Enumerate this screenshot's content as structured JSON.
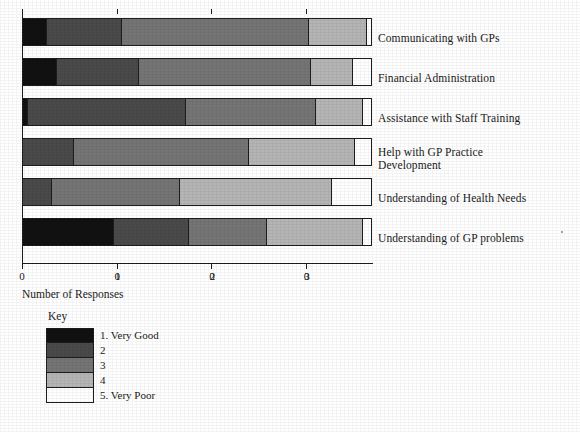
{
  "chart_data": {
    "type": "bar",
    "orientation": "horizontal",
    "stacked": true,
    "title": "",
    "xlabel": "Number of Responses",
    "ylabel": "",
    "xlim": [
      0,
      37
    ],
    "xticks": [
      0,
      10,
      20,
      30
    ],
    "xtick_labels": [
      "0",
      "10",
      "20",
      "30"
    ],
    "grid": false,
    "legend_title": "Key",
    "legend_position": "below-left",
    "categories": [
      "Communicating with GPs",
      "Financial Administration",
      "Assistance with Staff Training",
      "Help with GP Practice\nDevelopment",
      "Understanding of Health Needs",
      "Understanding of GP problems"
    ],
    "series": [
      {
        "name": "1. Very Good",
        "color": "#111111",
        "values": [
          2.5,
          3.5,
          0.4,
          0,
          0,
          9.7
        ]
      },
      {
        "name": "2",
        "color": "#4a4a4a",
        "values": [
          8.0,
          8.8,
          17.1,
          5.3,
          3.0,
          8.0
        ]
      },
      {
        "name": "3",
        "color": "#757575",
        "values": [
          19.9,
          18.4,
          14.0,
          18.7,
          13.8,
          8.3
        ]
      },
      {
        "name": "4",
        "color": "#b5b5b5",
        "values": [
          6.2,
          4.5,
          5.0,
          11.4,
          16.4,
          10.3
        ]
      },
      {
        "name": "5. Very Poor",
        "color": "#ffffff",
        "values": [
          0.5,
          2.0,
          1.0,
          1.8,
          4.3,
          1.0
        ]
      }
    ]
  },
  "axis": {
    "x_title": "Number of Responses",
    "tick_labels": [
      "0",
      "10",
      "20",
      "30"
    ]
  },
  "legend": {
    "title": "Key",
    "entries": [
      {
        "label": "1. Very Good",
        "color": "#111111"
      },
      {
        "label": "2",
        "color": "#4a4a4a"
      },
      {
        "label": "3",
        "color": "#757575"
      },
      {
        "label": "4",
        "color": "#b5b5b5"
      },
      {
        "label": "5. Very Poor",
        "color": "#ffffff"
      }
    ]
  }
}
